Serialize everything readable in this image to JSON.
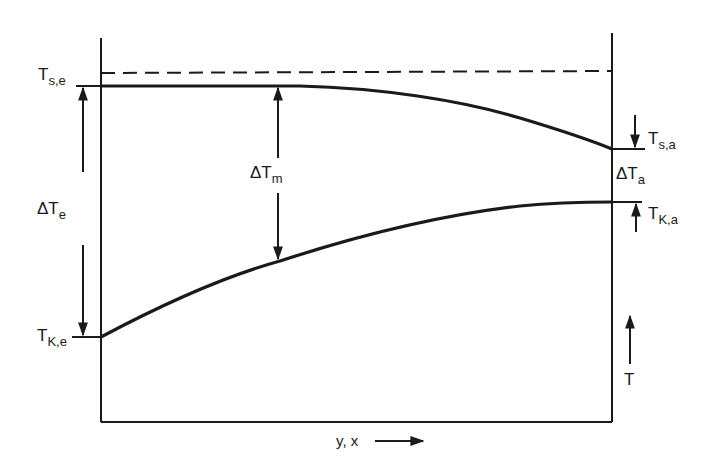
{
  "diagram": {
    "type": "temperature-profile",
    "colors": {
      "ink": "#1a1a1a",
      "paper": "#ffffff"
    },
    "labels": {
      "t_s_e": {
        "main": "T",
        "sub": "s,e"
      },
      "t_k_e": {
        "main": "T",
        "sub": "K,e"
      },
      "delta_t_e": {
        "main": "ΔT",
        "sub": "e"
      },
      "delta_t_m": {
        "main": "ΔT",
        "sub": "m"
      },
      "t_s_a": {
        "main": "T",
        "sub": "s,a"
      },
      "delta_t_a": {
        "main": "ΔT",
        "sub": "a"
      },
      "t_k_a": {
        "main": "T",
        "sub": "K,a"
      },
      "t_axis": "T",
      "x_axis": "y, x"
    },
    "curves": [
      {
        "name": "upper-curve-T_s",
        "style": "solid",
        "from": "T_s,e (entry)",
        "to": "T_s,a (exit)",
        "shape": "flat then falling"
      },
      {
        "name": "lower-curve-T_K",
        "style": "solid",
        "from": "T_K,e (entry)",
        "to": "T_K,a (exit)",
        "shape": "rising, concave"
      },
      {
        "name": "reference-line",
        "style": "dashed",
        "shape": "horizontal above T_s,e"
      }
    ]
  }
}
